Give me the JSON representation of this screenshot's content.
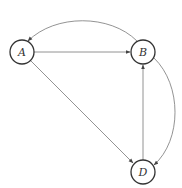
{
  "diagram": {
    "type": "directed-graph",
    "nodes": [
      {
        "id": "A",
        "label": "A",
        "cx": 22,
        "cy": 52,
        "r": 12
      },
      {
        "id": "B",
        "label": "B",
        "cx": 143,
        "cy": 52,
        "r": 12
      },
      {
        "id": "D",
        "label": "D",
        "cx": 143,
        "cy": 172,
        "r": 12
      }
    ],
    "edges": [
      {
        "from": "A",
        "to": "B",
        "shape": "straight"
      },
      {
        "from": "A",
        "to": "D",
        "shape": "straight"
      },
      {
        "from": "D",
        "to": "B",
        "shape": "straight"
      },
      {
        "from": "B",
        "to": "A",
        "shape": "curved"
      },
      {
        "from": "B",
        "to": "D",
        "shape": "curved"
      }
    ],
    "colors": {
      "node_stroke": "#333333",
      "edge_stroke": "#777777",
      "background": "#ffffff"
    }
  }
}
